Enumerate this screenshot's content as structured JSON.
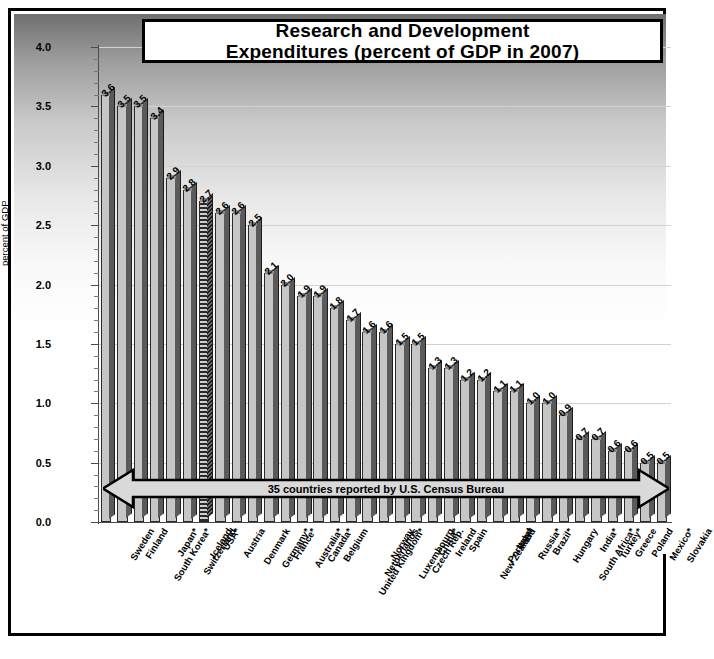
{
  "chart_data": {
    "type": "bar",
    "title": "Research and Development Expenditures (percent of GDP in 2007)",
    "title_line1": "Research and Development",
    "title_line2": "Expenditures (percent of GDP in 2007)",
    "xlabel": "",
    "ylabel": "percent of GDP",
    "ylim": [
      0.0,
      4.0
    ],
    "ytick_labels": [
      "0.0",
      "0.5",
      "1.0",
      "1.5",
      "2.0",
      "2.5",
      "3.0",
      "3.5",
      "4.0"
    ],
    "ytick_values": [
      0.0,
      0.5,
      1.0,
      1.5,
      2.0,
      2.5,
      3.0,
      3.5,
      4.0
    ],
    "minor_tick_step": 0.1,
    "grid": true,
    "legend": null,
    "annotation": "35 countries reported by U.S. Census Bureau",
    "highlight_category": "USA*",
    "categories": [
      "Sweden",
      "Finland",
      "South Korea*",
      "Japan*",
      "Switzerland",
      "Iceland",
      "USA*",
      "Austria",
      "Denmark",
      "Germany*",
      "France*",
      "Australia*",
      "Canada*",
      "Belgium",
      "United Kingdom*",
      "Netherlands",
      "Norway",
      "Luxembourg",
      "Czech Rep.",
      "China*",
      "Ireland",
      "Spain",
      "New Zealand",
      "Portugal",
      "Italy*",
      "Russia*",
      "Brazil*",
      "Hungary",
      "South Africa*",
      "India*",
      "Turkey*",
      "Greece",
      "Poland",
      "Mexico*",
      "Slovakia"
    ],
    "values": [
      3.6,
      3.5,
      3.5,
      3.4,
      2.9,
      2.8,
      2.7,
      2.6,
      2.6,
      2.5,
      2.1,
      2.0,
      1.9,
      1.9,
      1.8,
      1.7,
      1.6,
      1.6,
      1.5,
      1.5,
      1.3,
      1.3,
      1.2,
      1.2,
      1.1,
      1.1,
      1.0,
      1.0,
      0.9,
      0.7,
      0.7,
      0.6,
      0.6,
      0.5,
      0.5
    ],
    "value_labels": [
      "3.6",
      "3.5",
      "3.5",
      "3.4",
      "2.9",
      "2.8",
      "2.7",
      "2.6",
      "2.6",
      "2.5",
      "2.1",
      "2.0",
      "1.9",
      "1.9",
      "1.8",
      "1.7",
      "1.6",
      "1.6",
      "1.5",
      "1.5",
      "1.3",
      "1.3",
      "1.2",
      "1.2",
      "1.1",
      "1.1",
      "1.0",
      "1.0",
      "0.9",
      "0.7",
      "0.7",
      "0.6",
      "0.6",
      "0.5",
      "0.5"
    ]
  }
}
